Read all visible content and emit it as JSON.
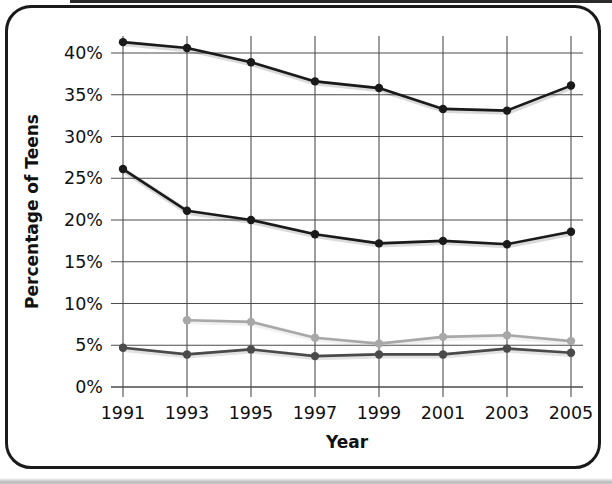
{
  "chart_data": {
    "type": "line",
    "title": "",
    "xlabel": "Year",
    "ylabel": "Percentage of Teens",
    "categories": [
      "1991",
      "1993",
      "1995",
      "1997",
      "1999",
      "2001",
      "2003",
      "2005"
    ],
    "x": [
      1991,
      1993,
      1995,
      1997,
      1999,
      2001,
      2003,
      2005
    ],
    "xlim": [
      1991,
      2005
    ],
    "ylim": [
      0,
      42
    ],
    "y_ticks": [
      0,
      5,
      10,
      15,
      20,
      25,
      30,
      35,
      40
    ],
    "y_tick_labels": [
      "0%",
      "5%",
      "10%",
      "15%",
      "20%",
      "25%",
      "30%",
      "35%",
      "40%"
    ],
    "grid": true,
    "legend": "none",
    "series": [
      {
        "name": "series-1-top",
        "color": "#1a1a1a",
        "marker": "circle",
        "values": [
          41.3,
          40.6,
          38.9,
          36.6,
          35.8,
          33.3,
          33.1,
          36.1
        ]
      },
      {
        "name": "series-2-upper-middle",
        "color": "#1a1a1a",
        "marker": "circle",
        "values": [
          26.1,
          21.1,
          20.0,
          18.3,
          17.2,
          17.5,
          17.1,
          18.6
        ]
      },
      {
        "name": "series-3-light-gray",
        "color": "#a8a8a8",
        "marker": "circle",
        "values": [
          null,
          8.0,
          7.8,
          5.9,
          5.2,
          6.0,
          6.2,
          5.5
        ]
      },
      {
        "name": "series-4-bottom",
        "color": "#4a4a4a",
        "marker": "circle",
        "values": [
          4.7,
          3.9,
          4.5,
          3.7,
          3.9,
          3.9,
          4.6,
          4.1
        ]
      }
    ]
  },
  "colors": {
    "frame": "#1a1a1a",
    "grid": "#4d4d4d",
    "background": "#ffffff",
    "text": "#111111"
  }
}
